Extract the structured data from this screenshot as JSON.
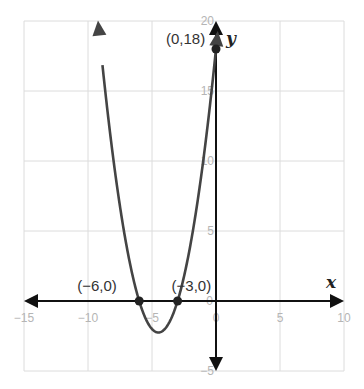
{
  "chart_data": {
    "type": "line",
    "title": "",
    "function": "y = x^2 + 9x + 18",
    "xlabel": "x",
    "ylabel": "y",
    "xlim": [
      -15,
      10
    ],
    "ylim": [
      -5,
      20
    ],
    "grid": true,
    "x_ticks": [
      -15,
      -10,
      -5,
      0,
      5,
      10
    ],
    "y_ticks": [
      -5,
      0,
      5,
      10,
      15,
      20
    ],
    "x_tick_labels": [
      "−15",
      "−10",
      "−5",
      "0",
      "5",
      "10"
    ],
    "y_tick_labels": [
      "−5",
      "0",
      "5",
      "10",
      "15",
      "20"
    ],
    "series": [
      {
        "name": "parabola",
        "color": "#444444",
        "coefficients": {
          "a": 1,
          "b": 9,
          "c": 18
        },
        "x_range": [
          -9.22,
          0.14
        ],
        "arrows": "both"
      }
    ],
    "points": [
      {
        "x": -6,
        "y": 0,
        "label": "(−6,0)"
      },
      {
        "x": -3,
        "y": 0,
        "label": "(−3,0)"
      },
      {
        "x": 0,
        "y": 18,
        "label": "(0,18)"
      }
    ],
    "vertex": {
      "x": -4.5,
      "y": -2.25
    }
  },
  "colors": {
    "grid": "#dcdcdc",
    "axes": "#111111",
    "curve": "#444444",
    "tick_text": "#b5b5b5",
    "point": "#222222"
  }
}
